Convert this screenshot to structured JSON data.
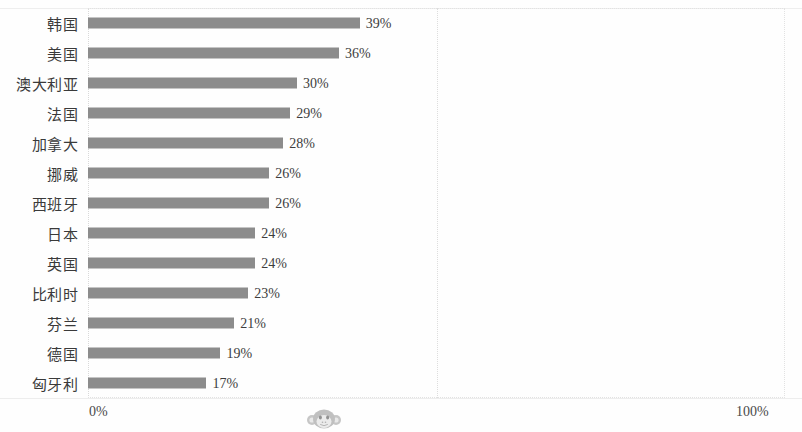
{
  "chart_data": {
    "type": "bar",
    "orientation": "horizontal",
    "title": "",
    "subtitle": "",
    "xlabel": "",
    "ylabel": "",
    "xlim": [
      0,
      100
    ],
    "grid": true,
    "gridlines_x": [
      50
    ],
    "legend": null,
    "value_suffix": "%",
    "axis_ticks": [
      "0%",
      "100%"
    ],
    "bar_color": "#8c8c8c",
    "categories": [
      "韩国",
      "美国",
      "澳大利亚",
      "法国",
      "加拿大",
      "挪威",
      "西班牙",
      "日本",
      "英国",
      "比利时",
      "芬兰",
      "德国",
      "匈牙利"
    ],
    "values": [
      39,
      36,
      30,
      29,
      28,
      26,
      26,
      24,
      24,
      23,
      21,
      19,
      17
    ],
    "value_labels": [
      "39%",
      "36%",
      "30%",
      "29%",
      "28%",
      "26%",
      "26%",
      "24%",
      "24%",
      "23%",
      "21%",
      "19%",
      "17%"
    ]
  },
  "axis": {
    "min_label": "0%",
    "max_label": "100%"
  },
  "watermark": {
    "name": "monkey-face-watermark"
  }
}
